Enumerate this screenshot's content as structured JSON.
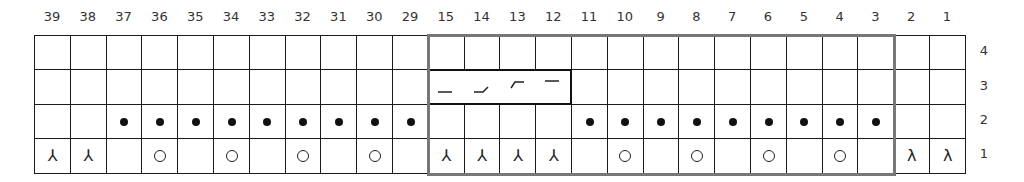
{
  "chart_data": {
    "type": "table",
    "title": "",
    "columns": [
      "39",
      "38",
      "37",
      "36",
      "35",
      "34",
      "33",
      "32",
      "31",
      "30",
      "29",
      "15",
      "14",
      "13",
      "12",
      "11",
      "10",
      "9",
      "8",
      "7",
      "6",
      "5",
      "4",
      "3",
      "2",
      "1"
    ],
    "rows": [
      "4",
      "3",
      "2",
      "1"
    ],
    "symbols": {
      "empty": "knit (blank)",
      "purl": "•",
      "yo": "○",
      "ssk": "⅄",
      "k2tog": "λ",
      "cable": "4-st cable"
    },
    "grid": {
      "4": [
        "",
        "",
        "",
        "",
        "",
        "",
        "",
        "",
        "",
        "",
        "",
        "",
        "",
        "",
        "",
        "",
        "",
        "",
        "",
        "",
        "",
        "",
        "",
        "",
        "",
        ""
      ],
      "3": [
        "",
        "",
        "",
        "",
        "",
        "",
        "",
        "",
        "",
        "",
        "",
        "cable",
        "cable",
        "cable",
        "cable",
        "",
        "",
        "",
        "",
        "",
        "",
        "",
        "",
        "",
        "",
        ""
      ],
      "2": [
        "",
        "",
        "purl",
        "purl",
        "purl",
        "purl",
        "purl",
        "purl",
        "purl",
        "purl",
        "purl",
        "",
        "",
        "",
        "",
        "purl",
        "purl",
        "purl",
        "purl",
        "purl",
        "purl",
        "purl",
        "purl",
        "purl",
        "",
        ""
      ],
      "1": [
        "ssk",
        "ssk",
        "",
        "yo",
        "",
        "yo",
        "",
        "yo",
        "",
        "yo",
        "",
        "ssk",
        "ssk",
        "ssk",
        "ssk",
        "",
        "yo",
        "",
        "yo",
        "",
        "yo",
        "",
        "yo",
        "",
        "k2tog",
        "k2tog"
      ]
    },
    "repeat": {
      "from_column": "15",
      "to_column": "3",
      "rows": [
        "1",
        "2",
        "3",
        "4"
      ],
      "border_color": "#777777"
    },
    "cable": {
      "row": "3",
      "from_column": "15",
      "to_column": "12"
    }
  },
  "symbol_glyphs": {
    "ssk": "⅄",
    "k2tog": "λ"
  }
}
